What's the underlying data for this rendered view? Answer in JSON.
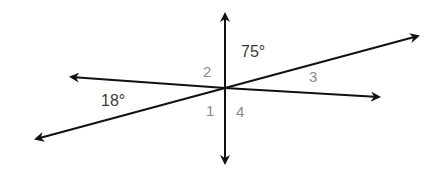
{
  "diagram": {
    "type": "intersecting-lines-angles",
    "angle_labels": {
      "angle_1": "1",
      "angle_2": "2",
      "angle_3": "3",
      "angle_4": "4"
    },
    "given_measures": {
      "top_right": "75°",
      "left": "18°"
    },
    "colors": {
      "line": "#111111",
      "label_gray": "#8a8a8a",
      "measure": "#3a3a3a"
    }
  }
}
